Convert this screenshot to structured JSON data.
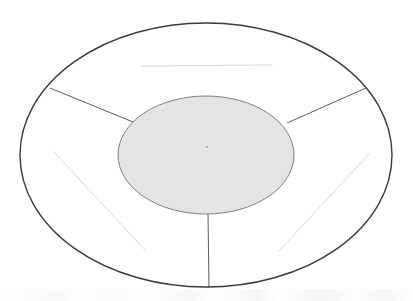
{
  "figure": {
    "title": "",
    "caption": "",
    "background_color": "#ffffff"
  },
  "colors": {
    "outer_ellipse_stroke": "#3a3a3a",
    "outer_ellipse_fill": "#ffffff",
    "inner_ellipse_stroke": "#808080",
    "inner_ellipse_fill": "#e4e4e4",
    "spoke_stroke": "#4a4a4a",
    "faint_line_stroke": "#d8d8d8",
    "center_mark": "#9a9a9a"
  },
  "shapes": {
    "outer_ellipse": {
      "name": "outer-boundary-ellipse",
      "cx": 206,
      "cy": 155,
      "rx": 186,
      "ry": 132,
      "stroke_width": 1.4,
      "fill": "#ffffff",
      "stroke": "#3a3a3a"
    },
    "inner_ellipse": {
      "name": "inner-shaded-ellipse",
      "cx": 206,
      "cy": 155,
      "rx": 88,
      "ry": 59,
      "stroke_width": 1.0,
      "fill": "#e4e4e4",
      "stroke": "#808080"
    },
    "center_mark": {
      "name": "center-point-mark",
      "cx": 207,
      "cy": 147,
      "r": 0.9
    }
  },
  "spokes": [
    {
      "name": "spoke-upper-left",
      "x1": 133,
      "y1": 122,
      "x2": 50,
      "y2": 88,
      "stroke": "#4a4a4a",
      "stroke_width": 0.9
    },
    {
      "name": "spoke-upper-right",
      "x1": 287,
      "y1": 123,
      "x2": 366,
      "y2": 88,
      "stroke": "#4a4a4a",
      "stroke_width": 0.9
    },
    {
      "name": "spoke-bottom-vertical",
      "x1": 208,
      "y1": 214,
      "x2": 209,
      "y2": 288,
      "stroke": "#4a4a4a",
      "stroke_width": 0.9
    }
  ],
  "faint_lines": [
    {
      "name": "faint-line-top-horizontal",
      "x1": 142,
      "y1": 66,
      "x2": 272,
      "y2": 65,
      "stroke": "#d9d9d9",
      "stroke_width": 1.0
    },
    {
      "name": "faint-line-lower-left-diagonal",
      "x1": 53,
      "y1": 151,
      "x2": 146,
      "y2": 251,
      "stroke": "#d9d9d9",
      "stroke_width": 1.0
    },
    {
      "name": "faint-line-lower-right-diagonal",
      "x1": 279,
      "y1": 251,
      "x2": 369,
      "y2": 154,
      "stroke": "#d9d9d9",
      "stroke_width": 1.0
    }
  ],
  "labels": []
}
